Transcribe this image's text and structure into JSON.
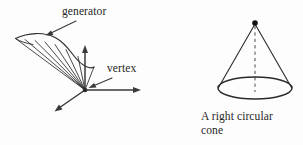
{
  "figure": {
    "kind": "geometry-diagram",
    "background_color": "#fdfdfd",
    "ink_color": "#262626",
    "panels": [
      {
        "id": "conical-surface",
        "name": "general conical surface with vertex and generator",
        "labels": [
          {
            "id": "generator",
            "text": "generator"
          },
          {
            "id": "vertex",
            "text": "vertex"
          }
        ],
        "elements": {
          "vertex_point": {
            "x": 85,
            "y": 90
          },
          "axes": [
            {
              "name": "vertical-axis",
              "to_x": 85,
              "to_y": 46
            },
            {
              "name": "horizontal-axis",
              "to_x": 141,
              "to_y": 90
            },
            {
              "name": "depth-axis",
              "to_x": 55,
              "to_y": 111
            }
          ],
          "generator_line_count": 7
        }
      },
      {
        "id": "right-circular-cone",
        "name": "right circular cone",
        "caption": "A right circular cone",
        "elements": {
          "apex_point": {
            "x": 255,
            "y": 23
          },
          "base_center": {
            "x": 255,
            "y": 88
          },
          "base_radius_x": 37,
          "base_radius_y": 11,
          "axis_style": "dashed"
        }
      }
    ]
  },
  "labels": {
    "generator": "generator",
    "vertex": "vertex",
    "cone_caption": "A right circular\ncone"
  }
}
